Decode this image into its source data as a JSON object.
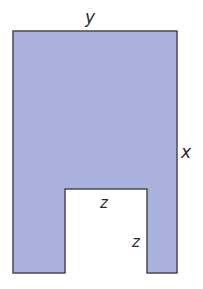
{
  "diagram": {
    "type": "geometric-shape",
    "fill_color": "#a9b1dc",
    "stroke_color": "#4a4a55",
    "outer": {
      "left": 13,
      "top": 31,
      "right": 177,
      "bottom": 273
    },
    "notch": {
      "left": 65,
      "right": 147,
      "top": 189
    },
    "labels": {
      "top": "y",
      "right": "x",
      "notch_top": "z",
      "notch_side": "z"
    }
  }
}
